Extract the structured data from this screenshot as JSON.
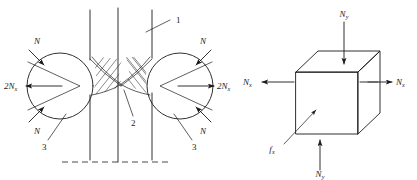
{
  "figure": {
    "background_color": "#ffffff",
    "line_color": "#1a1a1a"
  },
  "left_diagram": {
    "name": "roller-contact-diagram",
    "description": "Two rollers with strip passing between them and contact force vectors",
    "labels": {
      "n_upper_left": "N",
      "n_lower_left": "N",
      "n_upper_right": "N",
      "n_lower_right": "N",
      "two_nx_left": "2N",
      "two_nx_left_sub": "x",
      "two_nx_right": "2N",
      "two_nx_right_sub": "x",
      "callout_1": "1",
      "callout_2": "2",
      "callout_3_left": "3",
      "callout_3_right": "3"
    }
  },
  "right_diagram": {
    "name": "stress-element-cube",
    "description": "Cubic stress element with normal forces",
    "labels": {
      "ny_top": "N",
      "ny_top_sub": "y",
      "ny_bottom": "N",
      "ny_bottom_sub": "y",
      "nx_left": "N",
      "nx_left_sub": "x",
      "nx_right": "N",
      "nx_right_sub": "x",
      "fx": "f",
      "fx_sub": "x"
    }
  }
}
